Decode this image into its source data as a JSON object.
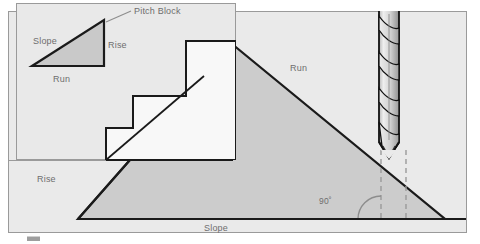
{
  "figure": {
    "type": "technical-diagram",
    "labels": {
      "pitch_block": "Pitch Block",
      "inset_slope": "Slope",
      "inset_rise": "Rise",
      "inset_run": "Run",
      "main_run": "Run",
      "main_rise": "Rise",
      "main_slope": "Slope",
      "angle": "90˚"
    },
    "colors": {
      "page_background": "#ffffff",
      "panel_fill": "#e9e9e9",
      "inset_fill": "#e8e8e8",
      "triangle_fill": "#cccccc",
      "inset_triangle_fill": "#c9c9c9",
      "stair_fill": "#f7f7f7",
      "outline": "#1a1a1a",
      "thin_rule": "#9a9a9a",
      "dashed_line": "#9a9a9a",
      "text": "#6e6e6e",
      "drill_body": "#d8d8d8",
      "drill_flute": "#f2f2f2",
      "drill_shadow": "#a8a8a8"
    },
    "geometry": {
      "frame": {
        "x": 8,
        "y": 11,
        "w": 459,
        "h": 222
      },
      "inset_panel": {
        "x": 16,
        "y": 3,
        "w": 220,
        "h": 157
      },
      "inset_triangle": [
        [
          32,
          66
        ],
        [
          104,
          66
        ],
        [
          104,
          20
        ]
      ],
      "main_triangle": [
        [
          78,
          219
        ],
        [
          232,
          44
        ],
        [
          445,
          219
        ]
      ],
      "stair_notch_top": {
        "x": 232,
        "y": 44
      },
      "dashed_lines_x": [
        381,
        406
      ],
      "angle_arc_center": [
        381,
        219
      ]
    },
    "icon_names": {
      "drill": "drill-bit-icon",
      "pitch_block": "pitch-block-triangle-icon",
      "stair": "stair-step-icon",
      "angle": "right-angle-arc-icon"
    }
  }
}
